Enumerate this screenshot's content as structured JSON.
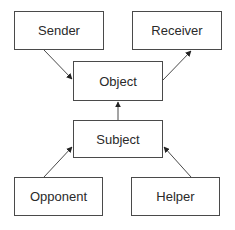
{
  "diagram": {
    "nodes": [
      {
        "id": "sender",
        "label": "Sender"
      },
      {
        "id": "receiver",
        "label": "Receiver"
      },
      {
        "id": "object",
        "label": "Object"
      },
      {
        "id": "subject",
        "label": "Subject"
      },
      {
        "id": "opponent",
        "label": "Opponent"
      },
      {
        "id": "helper",
        "label": "Helper"
      }
    ],
    "edges": [
      {
        "from": "sender",
        "to": "object"
      },
      {
        "from": "object",
        "to": "receiver"
      },
      {
        "from": "subject",
        "to": "object"
      },
      {
        "from": "opponent",
        "to": "subject"
      },
      {
        "from": "helper",
        "to": "subject"
      }
    ],
    "colors": {
      "stroke": "#4a4a4a",
      "text": "#2a2a2a",
      "background": "#ffffff"
    }
  }
}
